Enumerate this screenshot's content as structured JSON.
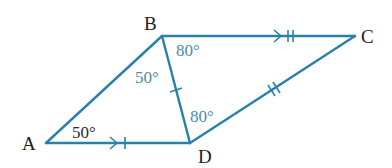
{
  "figure": {
    "type": "quadrilateral",
    "line_color": "#2a80aa",
    "angle_text_color": "#4a8cab",
    "vertices": [
      {
        "name": "A",
        "x": 46,
        "y": 143,
        "label_x": 22,
        "label_y": 150
      },
      {
        "name": "B",
        "x": 162,
        "y": 36,
        "label_x": 144,
        "label_y": 30
      },
      {
        "name": "C",
        "x": 355,
        "y": 36,
        "label_x": 361,
        "label_y": 43
      },
      {
        "name": "D",
        "x": 190,
        "y": 143,
        "label_x": 198,
        "label_y": 163
      }
    ],
    "edges": [
      {
        "from": "A",
        "to": "B",
        "marks": "none"
      },
      {
        "from": "B",
        "to": "C",
        "marks": "parallel-arrow + double-tick"
      },
      {
        "from": "C",
        "to": "D",
        "marks": "double-tick"
      },
      {
        "from": "D",
        "to": "A",
        "marks": "parallel-arrow + single-tick"
      },
      {
        "from": "B",
        "to": "D",
        "marks": "single-tick"
      }
    ],
    "angles": [
      {
        "at": "A",
        "triangle": "ABD",
        "label": "50°",
        "x": 72,
        "y": 138,
        "style": "dark"
      },
      {
        "at": "B",
        "triangle": "ABD",
        "label": "50°",
        "x": 135,
        "y": 83,
        "style": "blue"
      },
      {
        "at": "B",
        "triangle": "BCD",
        "label": "80°",
        "x": 176,
        "y": 56,
        "style": "blue"
      },
      {
        "at": "D",
        "triangle": "BCD",
        "label": "80°",
        "x": 190,
        "y": 122,
        "style": "blue"
      }
    ],
    "labels": {
      "A": "A",
      "B": "B",
      "C": "C",
      "D": "D",
      "angle_A": "50°",
      "angle_ABD": "50°",
      "angle_DBC": "80°",
      "angle_BDC": "80°"
    }
  }
}
